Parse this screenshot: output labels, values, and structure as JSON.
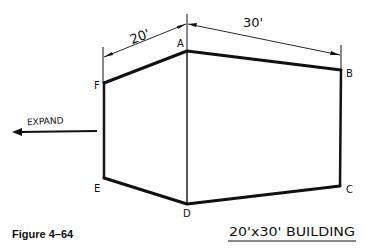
{
  "figure": {
    "caption": "Figure 4–64",
    "title": "20'x30' BUILDING"
  },
  "dimensions": {
    "left": "20'",
    "right": "30'"
  },
  "corners": {
    "A": "A",
    "B": "B",
    "C": "C",
    "D": "D",
    "E": "E",
    "F": "F"
  },
  "annotation": {
    "expand_label": "EXPAND",
    "expand_direction": "left"
  },
  "colors": {
    "ink": "#111111",
    "background": "#ffffff"
  }
}
